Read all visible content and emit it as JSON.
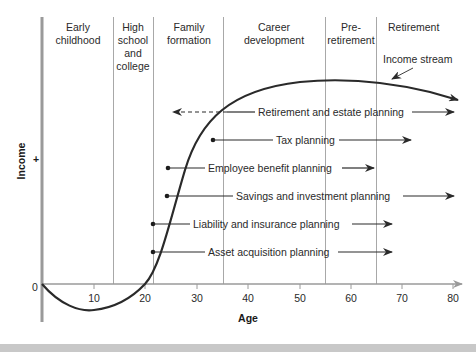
{
  "diagram": {
    "type": "financial-life-cycle",
    "stages": [
      {
        "lines": [
          "Early",
          "childhood"
        ]
      },
      {
        "lines": [
          "High",
          "school",
          "and",
          "college"
        ]
      },
      {
        "lines": [
          "Family",
          "formation"
        ]
      },
      {
        "lines": [
          "Career",
          "development"
        ]
      },
      {
        "lines": [
          "Pre-",
          "retirement"
        ]
      },
      {
        "lines": [
          "Retirement"
        ]
      }
    ],
    "curve_label": "Income stream",
    "plans": [
      {
        "label": "Retirement and estate planning",
        "start_dashed_to_age": 25,
        "end_age": 80
      },
      {
        "label": "Tax planning",
        "start_age": 33,
        "end_age": 72
      },
      {
        "label": "Employee benefit planning",
        "start_age": 25,
        "end_age": 65
      },
      {
        "label": "Savings and investment planning",
        "start_age": 24,
        "end_age": 80
      },
      {
        "label": "Liability and insurance planning",
        "start_age": 21.5,
        "end_age": 68
      },
      {
        "label": "Asset acquisition planning",
        "start_age": 21.5,
        "end_age": 68
      }
    ],
    "x_axis": {
      "title": "Age",
      "ticks": [
        "10",
        "20",
        "30",
        "40",
        "50",
        "60",
        "70",
        "80"
      ],
      "origin_label": "0"
    },
    "y_axis": {
      "title": "Income",
      "sign": "+"
    }
  }
}
